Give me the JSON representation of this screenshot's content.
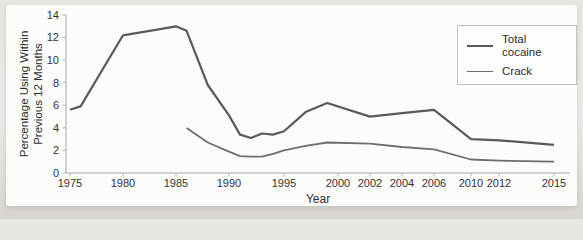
{
  "figure": {
    "x_axis_title": "Year",
    "y_title_lines": [
      "Percentage Using Within",
      "Previous 12 Months"
    ]
  },
  "chart_data": {
    "type": "line",
    "title": "",
    "xlabel": "Year",
    "ylabel": "Percentage Using Within Previous 12 Months",
    "ylim": [
      0,
      14
    ],
    "grid": false,
    "legend_position": "upper right",
    "y_ticks": [
      0,
      2,
      4,
      6,
      8,
      10,
      12,
      14
    ],
    "x_ticks": [
      1975,
      1980,
      1985,
      1990,
      1995,
      2000,
      2002,
      2004,
      2006,
      2010,
      2012,
      2015
    ],
    "series": [
      {
        "name": "Total cocaine",
        "color": "#5a5a5a",
        "width": 2.2,
        "points": [
          [
            1975,
            5.6
          ],
          [
            1976,
            5.9
          ],
          [
            1980,
            12.2
          ],
          [
            1985,
            13.0
          ],
          [
            1986,
            12.6
          ],
          [
            1988,
            7.8
          ],
          [
            1990,
            5.1
          ],
          [
            1991,
            3.4
          ],
          [
            1992,
            3.1
          ],
          [
            1993,
            3.5
          ],
          [
            1994,
            3.4
          ],
          [
            1995,
            3.7
          ],
          [
            1997,
            5.4
          ],
          [
            1999,
            6.2
          ],
          [
            2002,
            5.0
          ],
          [
            2004,
            5.3
          ],
          [
            2006,
            5.6
          ],
          [
            2010,
            3.0
          ],
          [
            2012,
            2.9
          ],
          [
            2015,
            2.5
          ]
        ]
      },
      {
        "name": "Crack",
        "color": "#6e6e6e",
        "width": 1.8,
        "points": [
          [
            1986,
            4.0
          ],
          [
            1988,
            2.7
          ],
          [
            1990,
            1.9
          ],
          [
            1991,
            1.5
          ],
          [
            1992,
            1.45
          ],
          [
            1993,
            1.45
          ],
          [
            1994,
            1.7
          ],
          [
            1995,
            2.0
          ],
          [
            1997,
            2.4
          ],
          [
            1999,
            2.7
          ],
          [
            2002,
            2.6
          ],
          [
            2004,
            2.3
          ],
          [
            2006,
            2.1
          ],
          [
            2010,
            1.2
          ],
          [
            2012,
            1.1
          ],
          [
            2015,
            1.0
          ]
        ]
      }
    ]
  }
}
